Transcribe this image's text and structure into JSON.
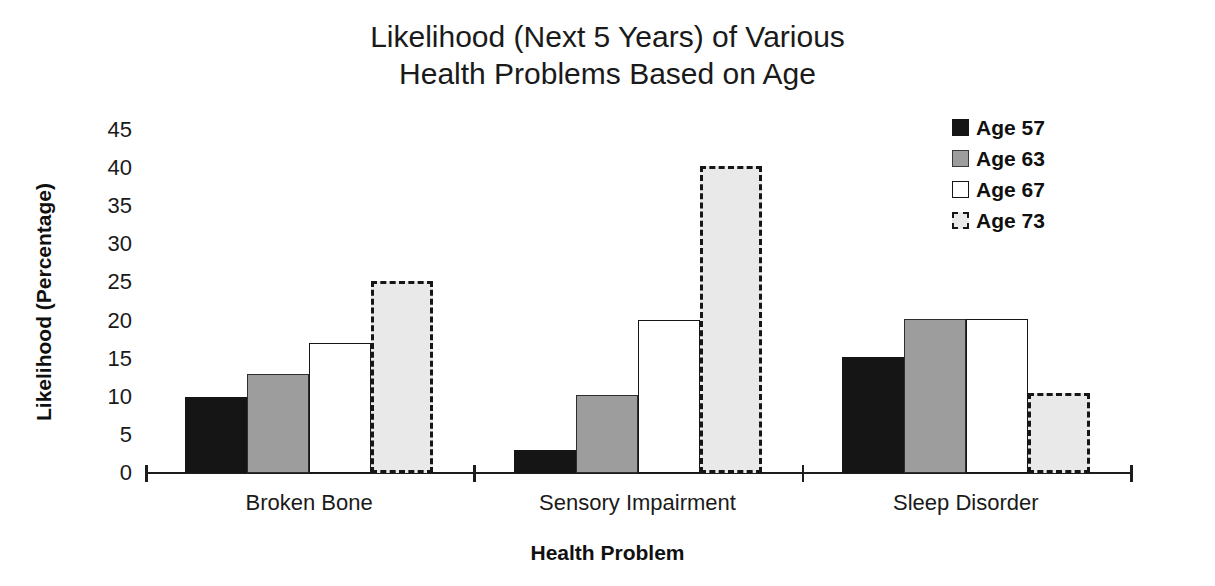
{
  "chart_data": {
    "type": "bar",
    "title": "Likelihood (Next 5 Years) of Various Health Problems Based on Age",
    "title_lines": [
      "Likelihood (Next 5 Years) of Various",
      "Health Problems Based on Age"
    ],
    "xlabel": "Health Problem",
    "ylabel": "Likelihood (Percentage)",
    "categories": [
      "Broken Bone",
      "Sensory Impairment",
      "Sleep Disorder"
    ],
    "ylim": [
      0,
      45
    ],
    "ytick_labels": [
      "0",
      "5",
      "10",
      "15",
      "20",
      "25",
      "30",
      "35",
      "40",
      "45"
    ],
    "ytick_values": [
      0,
      5,
      10,
      15,
      20,
      25,
      30,
      35,
      40,
      45
    ],
    "grid": false,
    "legend_position": "top-right",
    "series": [
      {
        "name": "Age 57",
        "values": [
          10.0,
          3.0,
          15.2
        ],
        "fill": "#151515",
        "border": "#151515",
        "border_style": "solid"
      },
      {
        "name": "Age 63",
        "values": [
          13.0,
          10.2,
          20.2
        ],
        "fill": "#9d9d9d",
        "border": "#2e2e2e",
        "border_style": "solid"
      },
      {
        "name": "Age 67",
        "values": [
          17.0,
          20.1,
          20.2
        ],
        "fill": "#ffffff",
        "border": "#161616",
        "border_style": "solid"
      },
      {
        "name": "Age 73",
        "values": [
          25.2,
          40.3,
          10.5
        ],
        "fill": "#e9e9e9",
        "border": "#161616",
        "border_style": "dashed"
      }
    ]
  }
}
